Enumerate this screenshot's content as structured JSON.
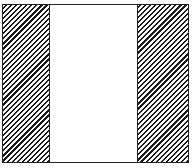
{
  "diagram": {
    "type": "partitioned-rectangle",
    "regions": [
      {
        "id": "left",
        "fill": "diagonal-hatch",
        "relative_width": 0.25
      },
      {
        "id": "center",
        "fill": "white",
        "relative_width": 0.48
      },
      {
        "id": "right",
        "fill": "diagonal-hatch",
        "relative_width": 0.27
      }
    ],
    "colors": {
      "stroke": "#222222",
      "hatch": "#1a1a1a",
      "background": "#ffffff"
    }
  }
}
